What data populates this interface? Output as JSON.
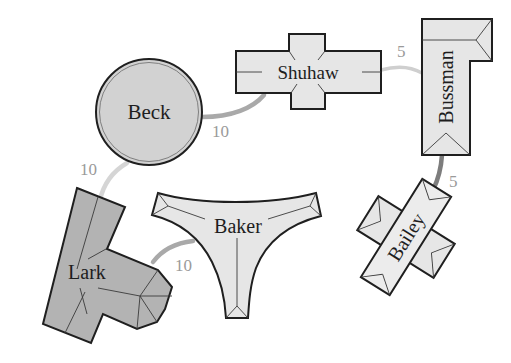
{
  "diagram": {
    "type": "building-map",
    "colors": {
      "light_fill": "#e6e6e6",
      "dark_fill": "#b3b3b3",
      "circle_fill": "#d2d2d2",
      "outline": "#1f1f1f",
      "path_light": "#c8c8c8",
      "path_mid": "#a8a8a8",
      "path_dark": "#7a7a7a",
      "distance_text": "#9a9a9a"
    },
    "buildings": [
      {
        "name": "Beck",
        "shape": "circle"
      },
      {
        "name": "Shuhaw",
        "shape": "cross"
      },
      {
        "name": "Bussman",
        "shape": "L-shape"
      },
      {
        "name": "Bailey",
        "shape": "rotated cross"
      },
      {
        "name": "Baker",
        "shape": "Y-curved"
      },
      {
        "name": "Lark",
        "shape": "T-shape"
      }
    ],
    "paths": [
      {
        "from": "Beck",
        "to": "Shuhaw",
        "distance": "10"
      },
      {
        "from": "Shuhaw",
        "to": "Bussman",
        "distance": "5"
      },
      {
        "from": "Bussman",
        "to": "Bailey",
        "distance": "5"
      },
      {
        "from": "Beck",
        "to": "Lark",
        "distance": "10"
      },
      {
        "from": "Lark",
        "to": "Baker",
        "distance": "10"
      }
    ]
  }
}
